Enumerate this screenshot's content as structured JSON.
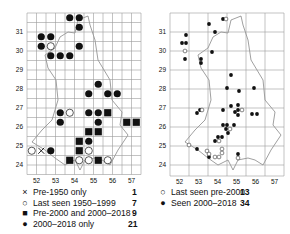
{
  "maps": {
    "left": {
      "x_ticks": [
        "52",
        "53",
        "54",
        "55",
        "56",
        "57"
      ],
      "y_ticks": [
        "31",
        "30",
        "29",
        "28",
        "27",
        "26",
        "25",
        "24"
      ],
      "grid": {
        "cols": 12,
        "rows": 17
      },
      "markers": [
        {
          "type": "filled",
          "col": 4,
          "row": 0
        },
        {
          "type": "filled",
          "col": 5,
          "row": 0
        },
        {
          "type": "filled",
          "col": 5,
          "row": 1
        },
        {
          "type": "filled",
          "col": 1,
          "row": 2
        },
        {
          "type": "filled",
          "col": 2,
          "row": 2
        },
        {
          "type": "filled",
          "col": 1,
          "row": 3
        },
        {
          "type": "open",
          "col": 2,
          "row": 3
        },
        {
          "type": "filled",
          "col": 5,
          "row": 3
        },
        {
          "type": "filled",
          "col": 2,
          "row": 4
        },
        {
          "type": "filled",
          "col": 3,
          "row": 4
        },
        {
          "type": "filled",
          "col": 4,
          "row": 4
        },
        {
          "type": "filled",
          "col": 7,
          "row": 7
        },
        {
          "type": "filled",
          "col": 6,
          "row": 8
        },
        {
          "type": "filled",
          "col": 8,
          "row": 8
        },
        {
          "type": "filled",
          "col": 9,
          "row": 8
        },
        {
          "type": "filled",
          "col": 3,
          "row": 10
        },
        {
          "type": "open",
          "col": 4,
          "row": 10
        },
        {
          "type": "filled",
          "col": 6,
          "row": 10
        },
        {
          "type": "filled",
          "col": 7,
          "row": 10
        },
        {
          "type": "square",
          "col": 8,
          "row": 10
        },
        {
          "type": "filled",
          "col": 3,
          "row": 11
        },
        {
          "type": "filled",
          "col": 7,
          "row": 11
        },
        {
          "type": "square",
          "col": 10,
          "row": 11
        },
        {
          "type": "square",
          "col": 11,
          "row": 11
        },
        {
          "type": "square",
          "col": 6,
          "row": 12
        },
        {
          "type": "square",
          "col": 7,
          "row": 12
        },
        {
          "type": "square",
          "col": 5,
          "row": 13
        },
        {
          "type": "filled",
          "col": 6,
          "row": 13
        },
        {
          "type": "open",
          "col": 0,
          "row": 14
        },
        {
          "type": "cross",
          "col": 1,
          "row": 14
        },
        {
          "type": "filled",
          "col": 2,
          "row": 14
        },
        {
          "type": "square",
          "col": 5,
          "row": 14
        },
        {
          "type": "open",
          "col": 6,
          "row": 14
        },
        {
          "type": "square",
          "col": 4,
          "row": 15
        },
        {
          "type": "open",
          "col": 5,
          "row": 15
        },
        {
          "type": "open",
          "col": 6,
          "row": 15
        },
        {
          "type": "square",
          "col": 7,
          "row": 15
        },
        {
          "type": "open",
          "col": 8,
          "row": 15
        }
      ],
      "legend": [
        {
          "symbol": "×",
          "icon": "cross-icon",
          "label": "Pre-1950 only",
          "count": "1"
        },
        {
          "symbol": "○",
          "icon": "open-circle-icon",
          "label": "Last seen 1950–1999",
          "count": "7"
        },
        {
          "symbol": "■",
          "icon": "filled-square-icon",
          "label": "Pre-2000 and 2000–2018",
          "count": "9"
        },
        {
          "symbol": "●",
          "icon": "filled-circle-icon",
          "label": "2000–2018 only",
          "count": "21"
        }
      ]
    },
    "right": {
      "x_ticks": [
        "52",
        "53",
        "54",
        "55",
        "56",
        "57"
      ],
      "y_ticks": [
        "31",
        "30",
        "29",
        "28",
        "27",
        "26",
        "25",
        "24"
      ],
      "grid": {
        "cols": 6,
        "rows": 8
      },
      "points": [
        {
          "type": "filled",
          "x": 223,
          "y": 19
        },
        {
          "type": "open",
          "x": 226,
          "y": 19
        },
        {
          "type": "filled",
          "x": 209,
          "y": 24
        },
        {
          "type": "filled",
          "x": 215,
          "y": 32
        },
        {
          "type": "filled",
          "x": 186,
          "y": 35
        },
        {
          "type": "filled",
          "x": 182,
          "y": 43
        },
        {
          "type": "filled",
          "x": 186,
          "y": 43
        },
        {
          "type": "open",
          "x": 185,
          "y": 51
        },
        {
          "type": "filled",
          "x": 212,
          "y": 52
        },
        {
          "type": "filled",
          "x": 185,
          "y": 59
        },
        {
          "type": "filled",
          "x": 201,
          "y": 59
        },
        {
          "type": "filled",
          "x": 201,
          "y": 63
        },
        {
          "type": "filled",
          "x": 231,
          "y": 75
        },
        {
          "type": "filled",
          "x": 227,
          "y": 88
        },
        {
          "type": "filled",
          "x": 239,
          "y": 91
        },
        {
          "type": "filled",
          "x": 254,
          "y": 88
        },
        {
          "type": "filled",
          "x": 231,
          "y": 106
        },
        {
          "type": "filled",
          "x": 223,
          "y": 110
        },
        {
          "type": "filled",
          "x": 238,
          "y": 110
        },
        {
          "type": "filled",
          "x": 238,
          "y": 105
        },
        {
          "type": "filled",
          "x": 235,
          "y": 112
        },
        {
          "type": "open",
          "x": 242,
          "y": 110
        },
        {
          "type": "filled",
          "x": 238,
          "y": 115
        },
        {
          "type": "filled",
          "x": 200,
          "y": 110
        },
        {
          "type": "filled",
          "x": 197,
          "y": 113
        },
        {
          "type": "open",
          "x": 202,
          "y": 110
        },
        {
          "type": "filled",
          "x": 252,
          "y": 114
        },
        {
          "type": "filled",
          "x": 257,
          "y": 114
        },
        {
          "type": "filled",
          "x": 223,
          "y": 125
        },
        {
          "type": "filled",
          "x": 227,
          "y": 125
        },
        {
          "type": "filled",
          "x": 234,
          "y": 125
        },
        {
          "type": "filled",
          "x": 226,
          "y": 129
        },
        {
          "type": "open",
          "x": 230,
          "y": 129
        },
        {
          "type": "filled",
          "x": 228,
          "y": 133
        },
        {
          "type": "filled",
          "x": 218,
          "y": 137
        },
        {
          "type": "filled",
          "x": 222,
          "y": 137
        },
        {
          "type": "filled",
          "x": 215,
          "y": 141
        },
        {
          "type": "open",
          "x": 219,
          "y": 141
        },
        {
          "type": "open",
          "x": 189,
          "y": 145
        },
        {
          "type": "filled",
          "x": 197,
          "y": 149
        },
        {
          "type": "open",
          "x": 207,
          "y": 151
        },
        {
          "type": "open",
          "x": 222,
          "y": 149
        },
        {
          "type": "open",
          "x": 222,
          "y": 153
        },
        {
          "type": "filled",
          "x": 209,
          "y": 157
        },
        {
          "type": "open",
          "x": 209,
          "y": 154
        },
        {
          "type": "open",
          "x": 215,
          "y": 157
        },
        {
          "type": "open",
          "x": 219,
          "y": 157
        },
        {
          "type": "filled",
          "x": 238,
          "y": 154
        },
        {
          "type": "open",
          "x": 238,
          "y": 158
        }
      ],
      "legend": [
        {
          "symbol": "○",
          "icon": "open-circle-icon",
          "label": "Last seen pre-2000",
          "count": "13"
        },
        {
          "symbol": "●",
          "icon": "filled-circle-icon",
          "label": "Seen 2000–2018",
          "count": "34"
        }
      ]
    }
  },
  "colors": {
    "grid": "#9a9a9a",
    "outline": "#777777",
    "marker": "#111111",
    "text": "#111111"
  }
}
